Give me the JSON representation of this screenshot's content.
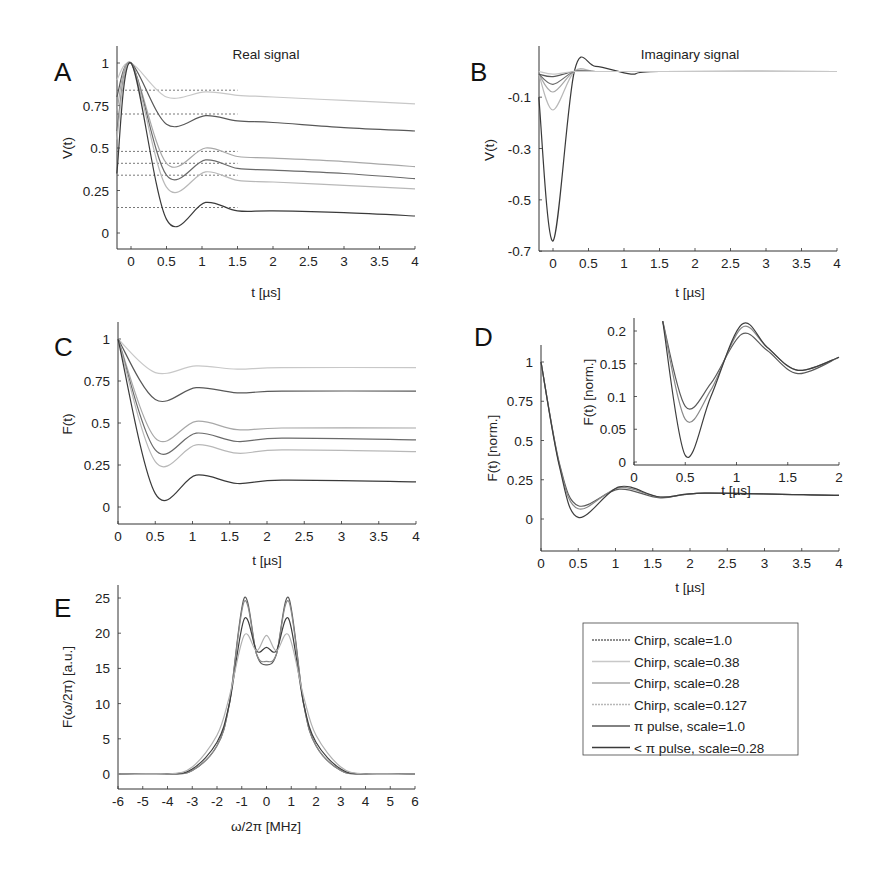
{
  "figure": {
    "panels": {
      "A": {
        "letter": "A",
        "title": "Real signal",
        "xlabel": "t [µs]",
        "ylabel": "V(t)"
      },
      "B": {
        "letter": "B",
        "title": "Imaginary signal",
        "xlabel": "t [µs]",
        "ylabel": "V(t)"
      },
      "C": {
        "letter": "C",
        "title": "",
        "xlabel": "t [µs]",
        "ylabel": "F(t)"
      },
      "D": {
        "letter": "D",
        "title": "",
        "xlabel": "t [µs]",
        "ylabel": "F(t) [norm.]",
        "inset": {
          "xlabel": "t [µs]",
          "ylabel": "F(t) [norm.]"
        }
      },
      "E": {
        "letter": "E",
        "title": "",
        "xlabel": "ω/2π [MHz]",
        "ylabel": "F(ω/2π) [a.u.]"
      }
    },
    "legend": {
      "entries": [
        {
          "label": "Chirp, scale=1.0",
          "color": "#6a6a6a",
          "dash": "2,1"
        },
        {
          "label": "Chirp, scale=0.38",
          "color": "#c8c8c8",
          "dash": ""
        },
        {
          "label": "Chirp, scale=0.28",
          "color": "#a8a8a8",
          "dash": ""
        },
        {
          "label": "Chirp, scale=0.127",
          "color": "#b8b8b8",
          "dash": "2,1"
        },
        {
          "label": "π pulse, scale=1.0",
          "color": "#585858",
          "dash": ""
        },
        {
          "label": "< π pulse, scale=0.28",
          "color": "#3a3a3a",
          "dash": ""
        }
      ]
    }
  },
  "chart_data": [
    {
      "panel": "A",
      "type": "line",
      "title": "Real signal",
      "xlabel": "t [µs]",
      "ylabel": "V(t)",
      "xlim": [
        -0.2,
        4
      ],
      "ylim": [
        -0.1,
        1.1
      ],
      "xticks": [
        "0",
        "0.5",
        "1",
        "1.5",
        "2",
        "2.5",
        "3",
        "3.5",
        "4"
      ],
      "yticks": [
        "0",
        "0.25",
        "0.5",
        "0.75",
        "1"
      ],
      "x": [
        -0.2,
        0,
        0.5,
        1.05,
        1.5,
        2,
        3,
        4
      ],
      "series": [
        {
          "name": "Chirp, scale=0.38",
          "values": [
            0.9,
            1.0,
            0.8,
            0.83,
            0.81,
            0.8,
            0.78,
            0.76
          ]
        },
        {
          "name": "π pulse, scale=1.0",
          "values": [
            0.8,
            1.0,
            0.64,
            0.69,
            0.66,
            0.65,
            0.62,
            0.6
          ]
        },
        {
          "name": "Chirp, scale=0.28",
          "values": [
            0.72,
            1.0,
            0.41,
            0.5,
            0.45,
            0.44,
            0.42,
            0.39
          ]
        },
        {
          "name": "Chirp, scale=1.0",
          "values": [
            0.6,
            1.0,
            0.34,
            0.43,
            0.38,
            0.37,
            0.35,
            0.32
          ]
        },
        {
          "name": "Chirp, scale=0.127",
          "values": [
            0.55,
            1.0,
            0.27,
            0.36,
            0.31,
            0.3,
            0.28,
            0.26
          ]
        },
        {
          "name": "< π pulse, scale=0.28",
          "values": [
            0.35,
            1.0,
            0.08,
            0.18,
            0.13,
            0.13,
            0.12,
            0.1
          ]
        }
      ],
      "baselines": [
        0.84,
        0.7,
        0.48,
        0.41,
        0.34,
        0.15
      ]
    },
    {
      "panel": "B",
      "type": "line",
      "title": "Imaginary signal",
      "xlabel": "t [µs]",
      "ylabel": "V(t)",
      "xlim": [
        -0.2,
        4
      ],
      "ylim": [
        -0.7,
        0.03
      ],
      "xticks": [
        "0",
        "0.5",
        "1",
        "1.5",
        "2",
        "2.5",
        "3",
        "3.5",
        "4"
      ],
      "yticks": [
        "-0.7",
        "-0.5",
        "-0.3",
        "-0.1"
      ],
      "x": [
        -0.2,
        0,
        0.3,
        0.6,
        1.1,
        1.5,
        4
      ],
      "series": [
        {
          "name": "< π pulse, scale=0.28",
          "values": [
            -0.1,
            -0.66,
            0.0,
            0.02,
            -0.01,
            0.0,
            0.0
          ]
        },
        {
          "name": "Chirp, scale=0.127",
          "values": [
            -0.01,
            -0.15,
            0.0,
            0.0,
            0.0,
            0.0,
            0.0
          ]
        },
        {
          "name": "Chirp, scale=0.28",
          "values": [
            -0.01,
            -0.08,
            0.0,
            0.0,
            0.0,
            0.0,
            0.0
          ]
        },
        {
          "name": "Chirp, scale=1.0",
          "values": [
            -0.01,
            -0.05,
            0.0,
            0.0,
            0.0,
            0.0,
            0.0
          ]
        },
        {
          "name": "π pulse, scale=1.0",
          "values": [
            -0.01,
            -0.02,
            0.0,
            0.0,
            0.0,
            0.0,
            0.0
          ]
        },
        {
          "name": "Chirp, scale=0.38",
          "values": [
            0.0,
            -0.01,
            0.0,
            0.0,
            0.0,
            0.0,
            0.0
          ]
        }
      ]
    },
    {
      "panel": "C",
      "type": "line",
      "xlabel": "t [µs]",
      "ylabel": "F(t)",
      "xlim": [
        0,
        4
      ],
      "ylim": [
        -0.1,
        1.1
      ],
      "xticks": [
        "0",
        "0.5",
        "1",
        "1.5",
        "2",
        "2.5",
        "3",
        "3.5",
        "4"
      ],
      "yticks": [
        "0",
        "0.25",
        "0.5",
        "0.75",
        "1"
      ],
      "x": [
        0,
        0.5,
        1.05,
        1.6,
        2.2,
        4
      ],
      "series": [
        {
          "name": "Chirp, scale=0.38",
          "values": [
            1.0,
            0.8,
            0.84,
            0.82,
            0.83,
            0.83
          ]
        },
        {
          "name": "π pulse, scale=1.0",
          "values": [
            1.0,
            0.64,
            0.71,
            0.68,
            0.69,
            0.69
          ]
        },
        {
          "name": "Chirp, scale=0.28",
          "values": [
            1.0,
            0.41,
            0.51,
            0.46,
            0.47,
            0.47
          ]
        },
        {
          "name": "Chirp, scale=1.0",
          "values": [
            1.0,
            0.34,
            0.44,
            0.39,
            0.41,
            0.4
          ]
        },
        {
          "name": "Chirp, scale=0.127",
          "values": [
            1.0,
            0.27,
            0.37,
            0.32,
            0.34,
            0.33
          ]
        },
        {
          "name": "< π pulse, scale=0.28",
          "values": [
            1.0,
            0.08,
            0.19,
            0.14,
            0.16,
            0.15
          ]
        }
      ]
    },
    {
      "panel": "D",
      "type": "line",
      "xlabel": "t [µs]",
      "ylabel": "F(t) [norm.]",
      "xlim": [
        0,
        4
      ],
      "ylim": [
        -0.2,
        1.1
      ],
      "xticks": [
        "0",
        "0.5",
        "1",
        "1.5",
        "2",
        "2.5",
        "3",
        "3.5",
        "4"
      ],
      "yticks": [
        "0",
        "0.25",
        "0.5",
        "0.75",
        "1"
      ],
      "x": [
        0,
        0.25,
        0.5,
        1.05,
        1.6,
        2.2,
        4
      ],
      "series": [
        {
          "name": "upper",
          "values": [
            1.0,
            0.35,
            0.085,
            0.19,
            0.135,
            0.165,
            0.15
          ]
        },
        {
          "name": "mid",
          "values": [
            1.0,
            0.34,
            0.065,
            0.2,
            0.14,
            0.165,
            0.15
          ]
        },
        {
          "name": "lower",
          "values": [
            1.0,
            0.33,
            0.01,
            0.205,
            0.14,
            0.165,
            0.15
          ]
        }
      ],
      "inset": {
        "xlabel": "t [µs]",
        "ylabel": "F(t) [norm.]",
        "xlim": [
          0,
          2
        ],
        "ylim": [
          -0.005,
          0.215
        ],
        "xticks": [
          "0",
          "0.5",
          "1",
          "1.5",
          "2"
        ],
        "yticks": [
          "0",
          "0.05",
          "0.1",
          "0.15",
          "0.2"
        ],
        "x": [
          0.28,
          0.5,
          0.75,
          1.05,
          1.3,
          1.6,
          2.0
        ],
        "series": [
          {
            "name": "upper",
            "values": [
              0.215,
              0.085,
              0.12,
              0.195,
              0.17,
              0.135,
              0.16
            ]
          },
          {
            "name": "mid",
            "values": [
              0.215,
              0.065,
              0.11,
              0.205,
              0.175,
              0.14,
              0.16
            ]
          },
          {
            "name": "lower",
            "values": [
              0.215,
              0.01,
              0.1,
              0.21,
              0.175,
              0.14,
              0.16
            ]
          }
        ]
      }
    },
    {
      "panel": "E",
      "type": "line",
      "xlabel": "ω/2π [MHz]",
      "ylabel": "F(ω/2π) [a.u.]",
      "xlim": [
        -6,
        6
      ],
      "ylim": [
        -2,
        27
      ],
      "xticks": [
        "-6",
        "-5",
        "-4",
        "-3",
        "-2",
        "-1",
        "0",
        "1",
        "2",
        "3",
        "4",
        "5",
        "6"
      ],
      "yticks": [
        "0",
        "5",
        "10",
        "15",
        "20",
        "25"
      ],
      "x": [
        -6,
        -4,
        -3,
        -2,
        -1.5,
        -0.9,
        -0.4,
        0,
        0.4,
        0.9,
        1.5,
        2,
        3,
        4,
        6
      ],
      "series": [
        {
          "name": "highest peak",
          "values": [
            0,
            0,
            0.5,
            4,
            10,
            25,
            17,
            15.5,
            17,
            25,
            10,
            4,
            0.5,
            0,
            0
          ]
        },
        {
          "name": "second",
          "values": [
            0,
            0,
            0.5,
            4,
            10,
            24.5,
            17,
            16,
            17,
            24.5,
            10,
            4,
            0.5,
            0,
            0
          ]
        },
        {
          "name": "third",
          "values": [
            0,
            0,
            0.7,
            4.5,
            10,
            22,
            17.5,
            18,
            17.5,
            22,
            10,
            4.5,
            0.7,
            0,
            0
          ]
        },
        {
          "name": "lowest peak",
          "values": [
            0,
            0,
            1,
            5.5,
            11,
            19.7,
            17.5,
            19.7,
            17.5,
            19.7,
            11,
            5.5,
            1,
            0,
            0
          ]
        }
      ]
    }
  ]
}
